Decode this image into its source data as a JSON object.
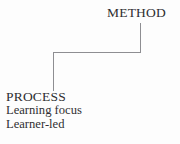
{
  "diagram": {
    "type": "hierarchy-elbow-connector",
    "background_color": "#fdfdfd",
    "line_color": "#8e8e92",
    "text_color": "#2e2e30",
    "nodes": {
      "method": {
        "label": "METHOD",
        "x": 107,
        "y": 6
      },
      "process": {
        "label": "PROCESS",
        "x": 6,
        "y": 90,
        "details": [
          {
            "text": "Learning focus"
          },
          {
            "text": "Learner-led"
          }
        ],
        "detail_first_word": "Learning",
        "detail_second_word": "focus",
        "detail_line_two": "Learner-led"
      }
    },
    "connector": {
      "name": "method-to-process-connector",
      "points": "140,23 140,52 53,52 53,91",
      "stroke_width": 1
    }
  }
}
